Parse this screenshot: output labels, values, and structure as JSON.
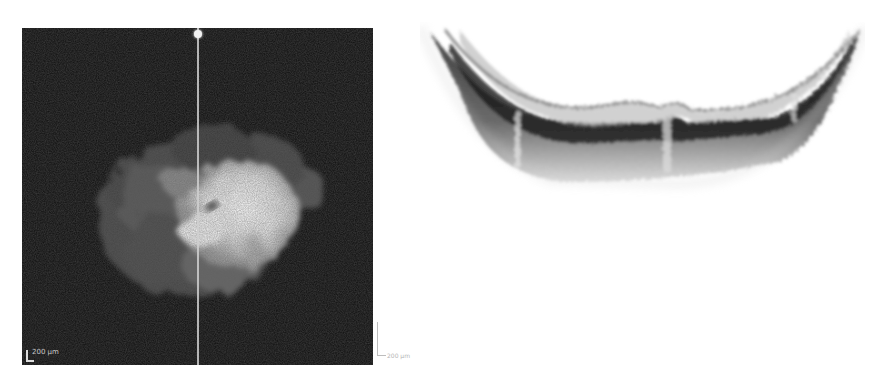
{
  "figure": {
    "left_panel": {
      "type": "en-face fundus / infrared image",
      "background_color": "#0e0e0e",
      "scan_line_color": "#cfcfcf",
      "scale_bar_label": "200 µm"
    },
    "right_panel": {
      "type": "OCT B-scan cross-section (inverted grayscale)",
      "background_color": "#ffffff",
      "scale_bar_label": "200 µm"
    }
  }
}
